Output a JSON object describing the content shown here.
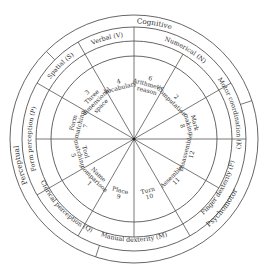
{
  "diagram": {
    "center": [
      134,
      139
    ],
    "radii": {
      "outer": 124,
      "domain_inner": 112,
      "factor_inner": 98,
      "test_outer": 83
    },
    "domains": [
      {
        "label": "Cognitive",
        "start": 135,
        "end": 18,
        "label_angle": 80
      },
      {
        "label": "Psychomotor",
        "start": 18,
        "end": -108,
        "label_angle": -38
      },
      {
        "label": "Perceptual",
        "start": -108,
        "end": -225,
        "label_angle": 193
      }
    ],
    "factors": [
      {
        "label": "Verbal (V)",
        "start": 90,
        "end": 120
      },
      {
        "label": "Numerical (N)",
        "start": 30,
        "end": 90
      },
      {
        "label": "Motor coordination (K)",
        "start": 0,
        "end": 30
      },
      {
        "label": "Finger dexterity (F)",
        "start": -60,
        "end": 0
      },
      {
        "label": "Manual dexterity (M)",
        "start": -120,
        "end": -60
      },
      {
        "label": "Clerical perception (Q)",
        "start": -150,
        "end": -120
      },
      {
        "label": "Form perception (P)",
        "start": 150,
        "end": 210
      },
      {
        "label": "Spatial (S)",
        "start": 120,
        "end": 150
      }
    ],
    "tests": [
      {
        "number": "4",
        "label": "Vocabulary",
        "start": 90,
        "end": 120
      },
      {
        "number": "6",
        "label": "Arithmetic reason",
        "start": 60,
        "end": 90
      },
      {
        "number": "2",
        "label": "Computation",
        "start": 30,
        "end": 60
      },
      {
        "number": "8",
        "label": "Mark making",
        "start": 0,
        "end": 30
      },
      {
        "number": "12",
        "label": "Disassemble",
        "start": -30,
        "end": 0
      },
      {
        "number": "11",
        "label": "Assemble",
        "start": -60,
        "end": -30
      },
      {
        "number": "10",
        "label": "Turn",
        "start": -90,
        "end": -60
      },
      {
        "number": "9",
        "label": "Place",
        "start": -120,
        "end": -90
      },
      {
        "number": "1",
        "label": "Name comparison",
        "start": -150,
        "end": -120
      },
      {
        "number": "5",
        "label": "Tool matching",
        "start": 180,
        "end": 210
      },
      {
        "number": "7",
        "label": "Form matching",
        "start": 150,
        "end": 180
      },
      {
        "number": "3",
        "label": "Three dimensional space",
        "start": 120,
        "end": 150
      }
    ]
  }
}
